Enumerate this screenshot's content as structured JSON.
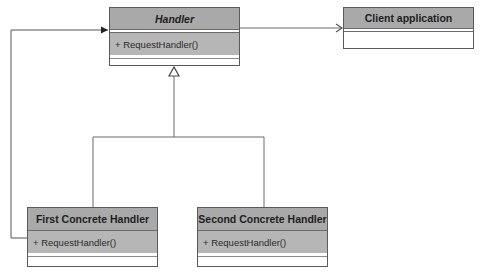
{
  "diagram": {
    "type": "UML class diagram (Chain of Responsibility)",
    "classes": {
      "handler": {
        "name": "Handler",
        "abstract": true,
        "methods": [
          "+ RequestHandler()"
        ]
      },
      "client": {
        "name": "Client application",
        "methods": []
      },
      "first": {
        "name": "First Concrete Handler",
        "methods": [
          "+ RequestHandler()"
        ]
      },
      "second": {
        "name": "Second Concrete Handler",
        "methods": [
          "+ RequestHandler()"
        ]
      }
    },
    "relations": [
      {
        "from": "Handler",
        "to": "Client application",
        "kind": "association (open arrow)"
      },
      {
        "from": "First Concrete Handler",
        "to": "Handler",
        "kind": "generalization (hollow triangle)"
      },
      {
        "from": "Second Concrete Handler",
        "to": "Handler",
        "kind": "generalization (hollow triangle)"
      },
      {
        "from": "First Concrete Handler",
        "to": "Handler",
        "kind": "association (filled arrow, successor)"
      }
    ],
    "colors": {
      "header": "#a9a9a9",
      "method": "#b6b6b6",
      "border": "#5a5a5a",
      "line": "#6a6a6a"
    }
  }
}
